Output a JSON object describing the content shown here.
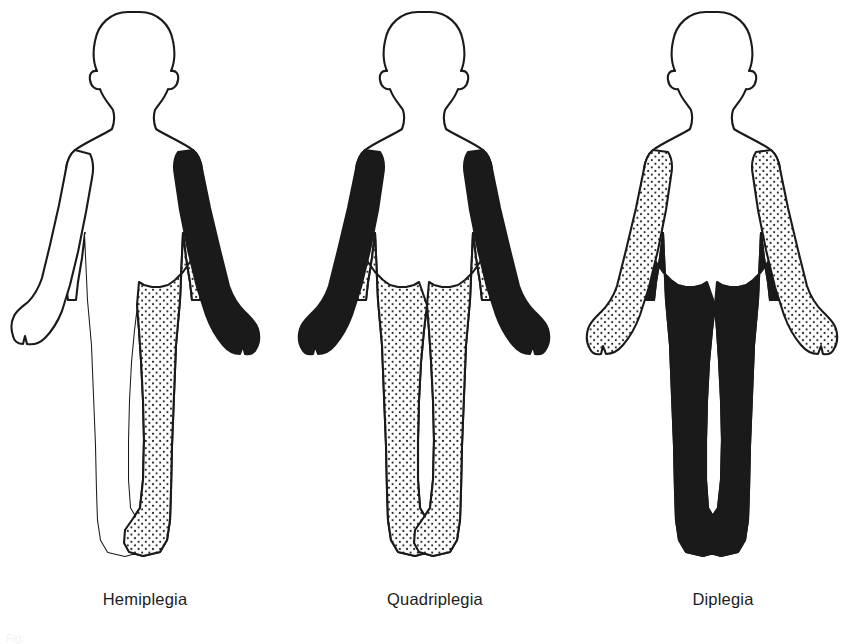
{
  "plate": {
    "background_color": "#ffffff",
    "outline_color": "#1a1a1a",
    "solid_fill_color": "#1a1a1a",
    "stipple_fill_color": "#1a1a1a",
    "unaffected_fill_color": "#ffffff",
    "bottom_cut_caption": "Fig."
  },
  "figures": [
    {
      "id": "hemiplegia",
      "label": "Hemiplegia",
      "center_x": 140,
      "regions": {
        "head": "none",
        "torso": "none",
        "left_arm": "none",
        "right_arm": "solid",
        "left_leg": "none",
        "right_leg": "stipple"
      }
    },
    {
      "id": "quadriplegia",
      "label": "Quadriplegia",
      "center_x": 455,
      "regions": {
        "head": "none",
        "torso": "none",
        "left_arm": "solid",
        "right_arm": "solid",
        "left_leg": "stipple",
        "right_leg": "stipple"
      }
    },
    {
      "id": "diplegia",
      "label": "Diplegia",
      "center_x": 748,
      "regions": {
        "head": "none",
        "torso": "none",
        "left_arm": "stipple",
        "right_arm": "stipple",
        "left_leg": "solid",
        "right_leg": "solid"
      }
    }
  ]
}
